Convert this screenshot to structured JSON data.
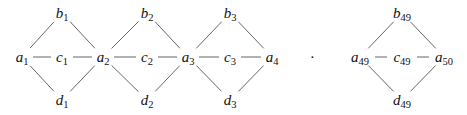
{
  "diagram": {
    "type": "graph",
    "nodes": [
      {
        "id": "a1",
        "base": "a",
        "sub": "1",
        "x": 22,
        "y": 60
      },
      {
        "id": "b1",
        "base": "b",
        "sub": "1",
        "x": 62,
        "y": 16
      },
      {
        "id": "c1",
        "base": "c",
        "sub": "1",
        "x": 62,
        "y": 60
      },
      {
        "id": "d1",
        "base": "d",
        "sub": "1",
        "x": 62,
        "y": 103
      },
      {
        "id": "a2",
        "base": "a",
        "sub": "2",
        "x": 103,
        "y": 60
      },
      {
        "id": "b2",
        "base": "b",
        "sub": "2",
        "x": 147,
        "y": 16
      },
      {
        "id": "c2",
        "base": "c",
        "sub": "2",
        "x": 147,
        "y": 60
      },
      {
        "id": "d2",
        "base": "d",
        "sub": "2",
        "x": 147,
        "y": 103
      },
      {
        "id": "a3",
        "base": "a",
        "sub": "3",
        "x": 188,
        "y": 60
      },
      {
        "id": "b3",
        "base": "b",
        "sub": "3",
        "x": 230,
        "y": 16
      },
      {
        "id": "c3",
        "base": "c",
        "sub": "3",
        "x": 230,
        "y": 60
      },
      {
        "id": "d3",
        "base": "d",
        "sub": "3",
        "x": 230,
        "y": 103
      },
      {
        "id": "a4",
        "base": "a",
        "sub": "4",
        "x": 272,
        "y": 60
      },
      {
        "id": "a49",
        "base": "a",
        "sub": "49",
        "x": 360,
        "y": 60
      },
      {
        "id": "b49",
        "base": "b",
        "sub": "49",
        "x": 402,
        "y": 16
      },
      {
        "id": "c49",
        "base": "c",
        "sub": "49",
        "x": 402,
        "y": 60
      },
      {
        "id": "d49",
        "base": "d",
        "sub": "49",
        "x": 402,
        "y": 103
      },
      {
        "id": "a50",
        "base": "a",
        "sub": "50",
        "x": 444,
        "y": 60
      }
    ],
    "edges": [
      [
        "a1",
        "b1"
      ],
      [
        "a1",
        "c1"
      ],
      [
        "a1",
        "d1"
      ],
      [
        "b1",
        "a2"
      ],
      [
        "c1",
        "a2"
      ],
      [
        "d1",
        "a2"
      ],
      [
        "a2",
        "b2"
      ],
      [
        "a2",
        "c2"
      ],
      [
        "a2",
        "d2"
      ],
      [
        "b2",
        "a3"
      ],
      [
        "c2",
        "a3"
      ],
      [
        "d2",
        "a3"
      ],
      [
        "a3",
        "b3"
      ],
      [
        "a3",
        "c3"
      ],
      [
        "a3",
        "d3"
      ],
      [
        "b3",
        "a4"
      ],
      [
        "c3",
        "a4"
      ],
      [
        "d3",
        "a4"
      ],
      [
        "a49",
        "b49"
      ],
      [
        "a49",
        "c49"
      ],
      [
        "a49",
        "d49"
      ],
      [
        "b49",
        "a50"
      ],
      [
        "c49",
        "a50"
      ],
      [
        "d49",
        "a50"
      ]
    ],
    "ellipsis": {
      "text": "·",
      "x": 312,
      "y": 58
    }
  }
}
